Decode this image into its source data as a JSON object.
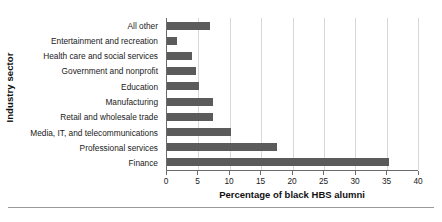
{
  "chart_data": {
    "type": "bar",
    "orientation": "horizontal",
    "title": "",
    "xlabel": "Percentage of black HBS alumni",
    "ylabel": "Industry sector",
    "categories": [
      "All other",
      "Entertainment and recreation",
      "Health care and social services",
      "Government and nonprofit",
      "Education",
      "Manufacturing",
      "Retail and wholesale trade",
      "Media, IT, and telecommunications",
      "Professional services",
      "Finance"
    ],
    "values": [
      6.8,
      1.6,
      4.0,
      4.7,
      5.1,
      7.3,
      7.3,
      10.2,
      17.6,
      35.4
    ],
    "xlim": [
      0,
      40
    ],
    "xticks": [
      0,
      5,
      10,
      15,
      20,
      25,
      30,
      35,
      40
    ],
    "xtick_labels": [
      "0",
      "5",
      "10",
      "15",
      "20",
      "25",
      "30",
      "35",
      "40"
    ],
    "grid": "vertical",
    "legend": "none",
    "bar_color": "#5b5b5b",
    "gridline_color": "#d8d8d8",
    "axis_color": "#6b6b6b"
  }
}
